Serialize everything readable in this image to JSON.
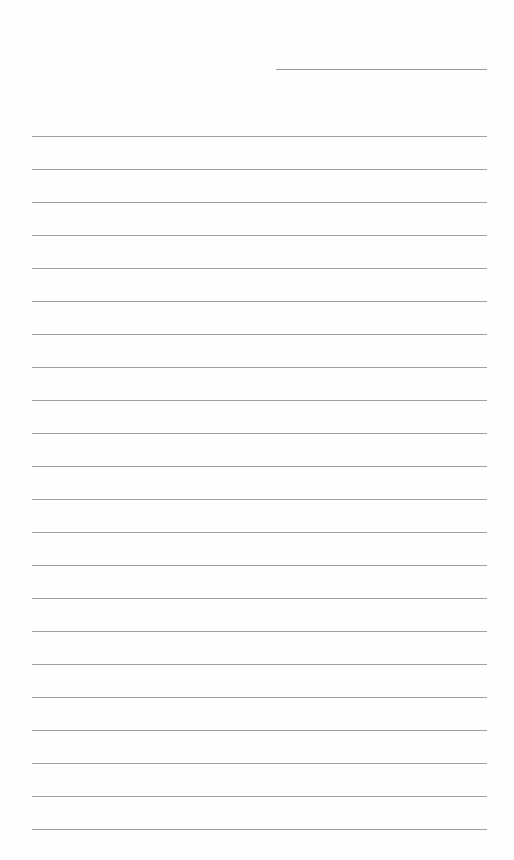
{
  "document": {
    "type": "lined-paper",
    "header_line": {
      "x": 276,
      "y": 69,
      "width": 211
    },
    "ruled_lines": {
      "count": 22,
      "start_y": 136,
      "spacing": 33,
      "x": 32,
      "width": 455,
      "color": "#a0a0a0"
    },
    "background": "#fefefe"
  }
}
